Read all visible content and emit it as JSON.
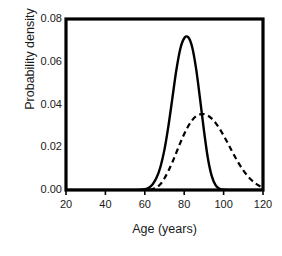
{
  "chart_data": {
    "type": "line",
    "title": "",
    "xlabel": "Age (years)",
    "ylabel": "Probability density",
    "xlim": [
      20,
      120
    ],
    "ylim": [
      0.0,
      0.08
    ],
    "xticks": [
      20,
      40,
      60,
      80,
      100,
      120
    ],
    "xtick_labels": [
      "20",
      "40",
      "60",
      "80",
      "100",
      "120"
    ],
    "yticks": [
      0.0,
      0.02,
      0.04,
      0.06,
      0.08
    ],
    "ytick_labels": [
      "0.00",
      "0.02",
      "0.04",
      "0.06",
      "0.08"
    ],
    "grid": false,
    "legend": null,
    "frame": "box",
    "series": [
      {
        "name": "solid-curve",
        "style": "solid",
        "color": "#000000",
        "peak_x": 82,
        "peak_y": 0.0715,
        "x": [
          20,
          30,
          40,
          50,
          55,
          58,
          60,
          62,
          64,
          66,
          68,
          70,
          72,
          74,
          76,
          78,
          80,
          82,
          84,
          86,
          88,
          90,
          92,
          94,
          96,
          98,
          100,
          110,
          120
        ],
        "y": [
          0.0,
          0.0,
          0.0,
          0.0,
          0.0,
          0.0001,
          0.0004,
          0.0011,
          0.0027,
          0.0058,
          0.011,
          0.019,
          0.03,
          0.043,
          0.056,
          0.066,
          0.071,
          0.0715,
          0.067,
          0.057,
          0.043,
          0.028,
          0.015,
          0.0065,
          0.0022,
          0.0006,
          0.0001,
          0.0,
          0.0
        ]
      },
      {
        "name": "dashed-curve",
        "style": "dashed",
        "color": "#000000",
        "peak_x": 90,
        "peak_y": 0.0355,
        "x": [
          20,
          40,
          55,
          60,
          62,
          64,
          66,
          68,
          70,
          72,
          74,
          76,
          78,
          80,
          82,
          84,
          86,
          88,
          90,
          92,
          94,
          96,
          98,
          100,
          102,
          104,
          106,
          108,
          110,
          112,
          114,
          116,
          118,
          120
        ],
        "y": [
          0.0,
          0.0,
          0.0,
          0.0,
          0.0001,
          0.0004,
          0.0012,
          0.0028,
          0.0055,
          0.009,
          0.013,
          0.0175,
          0.022,
          0.0262,
          0.0298,
          0.0326,
          0.0345,
          0.0354,
          0.0355,
          0.0348,
          0.0334,
          0.0313,
          0.0286,
          0.0255,
          0.0221,
          0.0186,
          0.0152,
          0.012,
          0.0092,
          0.0068,
          0.0048,
          0.0032,
          0.002,
          0.0011
        ]
      }
    ]
  },
  "axes": {
    "xlabel": "Age (years)",
    "ylabel": "Probability density",
    "xtick_labels": [
      "20",
      "40",
      "60",
      "80",
      "100",
      "120"
    ],
    "ytick_labels": [
      "0.00",
      "0.02",
      "0.04",
      "0.06",
      "0.08"
    ]
  },
  "colors": {
    "axis": "#000000",
    "curve": "#000000",
    "background": "#ffffff",
    "text": "#1a1a1a"
  }
}
